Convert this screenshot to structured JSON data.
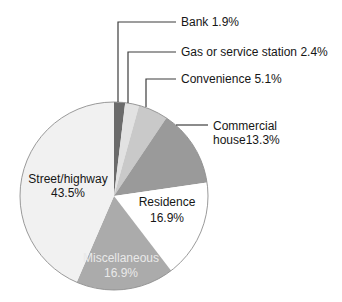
{
  "chart_data": {
    "type": "pie",
    "title": "",
    "categories": [
      "Bank",
      "Gas or service station",
      "Convenience",
      "Commercial house",
      "Residence",
      "Miscellaneous",
      "Street/highway"
    ],
    "values": [
      1.9,
      2.4,
      5.1,
      13.3,
      16.9,
      16.9,
      43.5
    ],
    "unit": "%",
    "direction": "clockwise",
    "start_angle_deg": 0,
    "legend": "none",
    "colors": [
      "#6b6b6b",
      "#e2e2e2",
      "#c9c9c9",
      "#9a9a9a",
      "#ffffff",
      "#ababab",
      "#f1f1f1"
    ],
    "outline_color": "#8f8f8f",
    "leader_line_color": "#3d3d3d",
    "label_color": "#161616",
    "miscellaneous_label_color": "#e9e9e9",
    "labels": {
      "bank": "Bank 1.9%",
      "gas": "Gas or service station 2.4%",
      "convenience": "Convenience 5.1%",
      "commercial_line1": "Commercial",
      "commercial_line2": "house13.3%",
      "street_line1": "Street/highway",
      "street_line2": "43.5%",
      "residence_line1": "Residence",
      "residence_line2": "16.9%",
      "miscellaneous_line1": "Miscellaneous",
      "miscellaneous_line2": "16.9%"
    }
  }
}
